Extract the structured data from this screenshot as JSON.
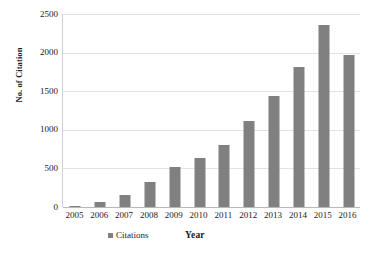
{
  "chart_data": {
    "type": "bar",
    "title": "",
    "xlabel": "Year",
    "ylabel": "No. of Citation",
    "categories": [
      "2005",
      "2006",
      "2007",
      "2008",
      "2009",
      "2010",
      "2011",
      "2012",
      "2013",
      "2014",
      "2015",
      "2016"
    ],
    "series": [
      {
        "name": "Citations",
        "values": [
          10,
          60,
          150,
          325,
          520,
          630,
          805,
          1120,
          1435,
          1815,
          2360,
          1970
        ]
      }
    ],
    "ylim": [
      0,
      2500
    ],
    "y_ticks": [
      0,
      500,
      1000,
      1500,
      2000,
      2500
    ],
    "y_tick_labels": [
      "0",
      "500",
      "1000",
      "1500",
      "2000",
      "2500"
    ],
    "grid": true,
    "legend_position": "bottom",
    "legend_entries": [
      "Citations"
    ],
    "bar_color": "#808080",
    "gridline_color": "#e2e2e2",
    "axis_color": "#b8b8b8",
    "background_color": "#ffffff"
  }
}
